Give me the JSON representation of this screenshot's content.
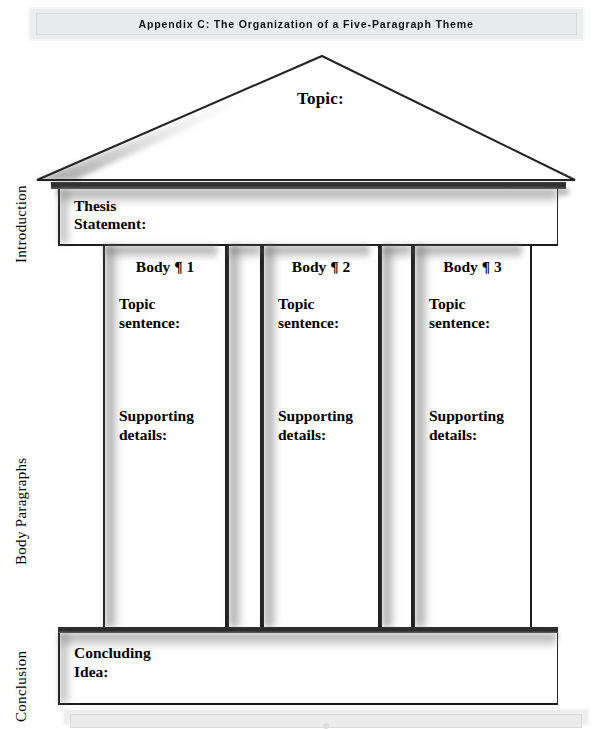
{
  "running_head": {
    "text": "Appendix C: The Organization of a Five-Paragraph Theme"
  },
  "diagram": {
    "roof": {
      "topic_label": "Topic:"
    },
    "introduction": {
      "side_label": "Introduction",
      "thesis_label": "Thesis\nStatement:"
    },
    "body": {
      "side_label": "Body Paragraphs",
      "columns": [
        {
          "heading": "Body ¶ 1",
          "topic_sentence": "Topic\nsentence:",
          "supporting_details": "Supporting\ndetails:"
        },
        {
          "heading": "Body ¶ 2",
          "topic_sentence": "Topic\nsentence:",
          "supporting_details": "Supporting\ndetails:"
        },
        {
          "heading": "Body ¶ 3",
          "topic_sentence": "Topic\nsentence:",
          "supporting_details": "Supporting\ndetails:"
        }
      ]
    },
    "conclusion": {
      "side_label": "Conclusion",
      "concluding_label": "Concluding\nIdea:"
    }
  },
  "colors": {
    "ink": "#1b1b1b",
    "page": "#ffffff",
    "bar_fill": "#eceded",
    "bar_border": "#d8d9da",
    "shadow": "#6e6e6e"
  }
}
